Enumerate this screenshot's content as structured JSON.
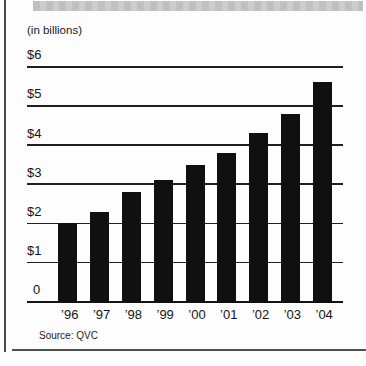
{
  "chart_data": {
    "type": "bar",
    "units_label": "(in billions)",
    "categories": [
      "’96",
      "’97",
      "’98",
      "’99",
      "’00",
      "’01",
      "’02",
      "’03",
      "’04"
    ],
    "values": [
      2.0,
      2.3,
      2.8,
      3.1,
      3.5,
      3.8,
      4.3,
      4.8,
      5.6
    ],
    "y_ticks": [
      {
        "label": "$6",
        "value": 6
      },
      {
        "label": "$5",
        "value": 5
      },
      {
        "label": "$4",
        "value": 4
      },
      {
        "label": "$3",
        "value": 3
      },
      {
        "label": "$2",
        "value": 2
      },
      {
        "label": "$1",
        "value": 1
      },
      {
        "label": "0",
        "value": 0
      }
    ],
    "ylim": [
      0,
      6
    ],
    "xlabel": "",
    "ylabel": "",
    "grid": "horizontal-lines",
    "legend": "none",
    "source": "Source: QVC",
    "bar_color": "#101010",
    "grid_color": "#1f1f1f",
    "header_strip_color": "#cacaca",
    "rule_color": "#4a4a4a"
  }
}
